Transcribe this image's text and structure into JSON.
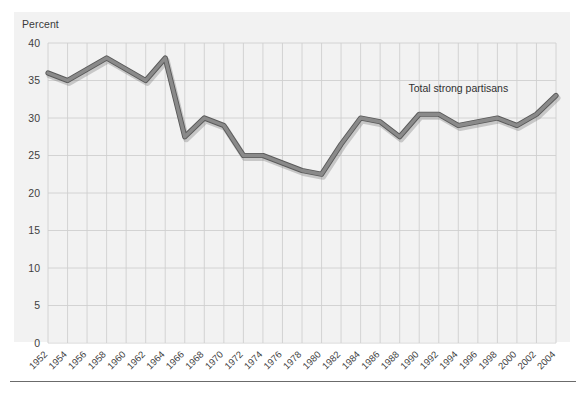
{
  "figure": {
    "y_axis_title": "Percent",
    "annotation": "Total strong partisans",
    "background_color": "#f2f2f2",
    "line_color": "#8a8a8a",
    "line_edge_color": "#5a5a5a",
    "grid_color": "#cfcfcf",
    "text_color": "#3f3f3f",
    "rule_color": "#6b6b6b"
  },
  "chart_data": {
    "type": "line",
    "title": "",
    "xlabel": "",
    "ylabel": "Percent",
    "ylim": [
      0,
      40
    ],
    "yticks": [
      0,
      5,
      10,
      15,
      20,
      25,
      30,
      35,
      40
    ],
    "ytick_labels": [
      "0",
      "5",
      "10",
      "15",
      "20",
      "25",
      "30",
      "35",
      "40"
    ],
    "grid": true,
    "legend": "none",
    "annotations": [
      {
        "text": "Total strong partisans",
        "x": 1994,
        "y": 33.5
      }
    ],
    "categories": [
      "1952",
      "1954",
      "1956",
      "1958",
      "1960",
      "1962",
      "1964",
      "1966",
      "1968",
      "1970",
      "1972",
      "1974",
      "1976",
      "1978",
      "1980",
      "1982",
      "1984",
      "1986",
      "1988",
      "1990",
      "1992",
      "1994",
      "1996",
      "1998",
      "2000",
      "2002",
      "2004"
    ],
    "x": [
      1952,
      1954,
      1956,
      1958,
      1960,
      1962,
      1964,
      1966,
      1968,
      1970,
      1972,
      1974,
      1976,
      1978,
      1980,
      1982,
      1984,
      1986,
      1988,
      1990,
      1992,
      1994,
      1996,
      1998,
      2000,
      2002,
      2004
    ],
    "series": [
      {
        "name": "Total strong partisans",
        "values": [
          36.0,
          35.0,
          36.5,
          38.0,
          36.5,
          35.0,
          38.0,
          27.5,
          30.0,
          29.0,
          25.0,
          25.0,
          24.0,
          23.0,
          22.5,
          26.5,
          30.0,
          29.5,
          27.5,
          30.5,
          30.5,
          29.0,
          29.5,
          30.0,
          29.0,
          30.5,
          33.0
        ]
      }
    ],
    "xtick_labels": [
      "1952",
      "1954",
      "1956",
      "1958",
      "1960",
      "1962",
      "1964",
      "1966",
      "1968",
      "1970",
      "1972",
      "1974",
      "1976",
      "1978",
      "1980",
      "1982",
      "1984",
      "1986",
      "1988",
      "1990",
      "1992",
      "1994",
      "1996",
      "1998",
      "2000",
      "2002",
      "2004"
    ]
  }
}
